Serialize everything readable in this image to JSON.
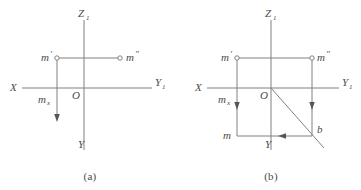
{
  "figure": {
    "stroke_color": "#808080",
    "text_color": "#4a4a4a",
    "background": "#ffffff",
    "panels": [
      {
        "caption": "(a)",
        "axes": {
          "z_label": "Z",
          "z_sub": "1",
          "x_label": "X",
          "y1_label": "Y",
          "y1_sub": "1",
          "y_label": "Y",
          "origin_label": "O"
        },
        "points": [
          {
            "name": "m-prime",
            "label": "m",
            "prime": "′",
            "marker": "open-circle"
          },
          {
            "name": "m-double-prime",
            "label": "m",
            "prime": "″",
            "marker": "open-circle"
          },
          {
            "name": "m-sub-x",
            "label": "m",
            "sub": "x",
            "marker": "none"
          }
        ]
      },
      {
        "caption": "(b)",
        "axes": {
          "z_label": "Z",
          "z_sub": "1",
          "x_label": "X",
          "y1_label": "Y",
          "y1_sub": "1",
          "y_label": "Y",
          "origin_label": "O"
        },
        "points": [
          {
            "name": "m-prime",
            "label": "m",
            "prime": "′",
            "marker": "open-circle"
          },
          {
            "name": "m-double-prime",
            "label": "m",
            "prime": "″",
            "marker": "open-circle"
          },
          {
            "name": "m-sub-x",
            "label": "m",
            "sub": "x",
            "marker": "none"
          },
          {
            "name": "m",
            "label": "m",
            "marker": "none"
          },
          {
            "name": "b",
            "label": "b",
            "marker": "none"
          }
        ]
      }
    ]
  }
}
